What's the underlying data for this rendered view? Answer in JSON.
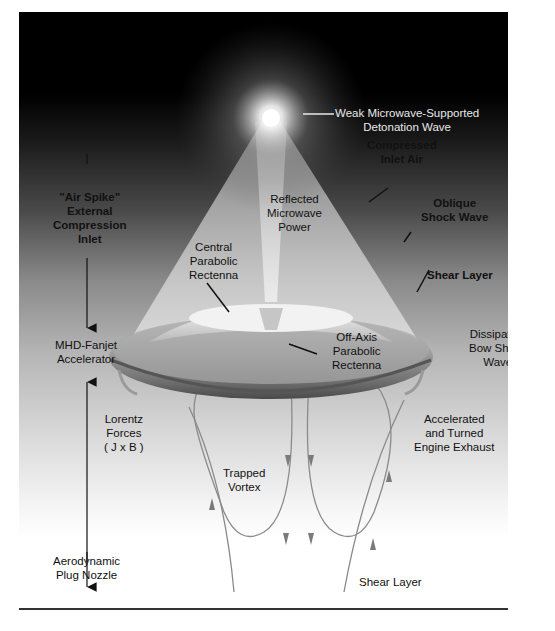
{
  "diagram": {
    "labels": {
      "detonation_wave": [
        "Weak Microwave-Supported",
        "Detonation Wave"
      ],
      "compressed_air": [
        "Compressed",
        "Inlet Air"
      ],
      "oblique_shock": [
        "Oblique",
        "Shock Wave"
      ],
      "air_spike": [
        "\"Air Spike\"",
        "External",
        "Compression",
        "Inlet"
      ],
      "reflected_power": [
        "Reflected",
        "Microwave",
        "Power"
      ],
      "central_rectenna": [
        "Central",
        "Parabolic",
        "Rectenna"
      ],
      "shear_layer_top": "Shear Layer",
      "mhd_fanjet": [
        "MHD-Fanjet",
        "Accelerator"
      ],
      "off_axis_rectenna": [
        "Off-Axis",
        "Parabolic",
        "Rectenna"
      ],
      "bow_shock": [
        "Dissipating",
        "Bow Shock",
        "Wave"
      ],
      "lorentz": [
        "Lorentz",
        "Forces",
        "( J x B )"
      ],
      "exhaust": [
        "Accelerated",
        "and Turned",
        "Engine Exhaust"
      ],
      "vortex": [
        "Trapped",
        "Vortex"
      ],
      "plug_nozzle": [
        "Aerodynamic",
        "Plug Nozzle"
      ],
      "shear_layer_bottom": "Shear Layer"
    },
    "colors": {
      "sky_top": "#000000",
      "background_bottom": "#ffffff",
      "glow": "#ffffff",
      "craft_body": "#9a9a9a",
      "flow_lines": "#8a8a8a",
      "leader_lines": "#111111"
    }
  }
}
